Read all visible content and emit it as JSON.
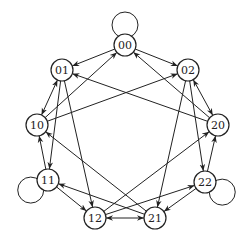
{
  "diagram": {
    "type": "directed-graph",
    "nodes": [
      {
        "id": "00",
        "label": "00",
        "x": 125,
        "y": 45
      },
      {
        "id": "01",
        "label": "01",
        "x": 62,
        "y": 70
      },
      {
        "id": "02",
        "label": "02",
        "x": 188,
        "y": 70
      },
      {
        "id": "10",
        "label": "10",
        "x": 37,
        "y": 125
      },
      {
        "id": "20",
        "label": "20",
        "x": 218,
        "y": 125
      },
      {
        "id": "11",
        "label": "11",
        "x": 48,
        "y": 180
      },
      {
        "id": "22",
        "label": "22",
        "x": 205,
        "y": 182
      },
      {
        "id": "12",
        "label": "12",
        "x": 95,
        "y": 218
      },
      {
        "id": "21",
        "label": "21",
        "x": 155,
        "y": 218
      }
    ],
    "edges": [
      {
        "from": "00",
        "to": "00"
      },
      {
        "from": "00",
        "to": "01"
      },
      {
        "from": "00",
        "to": "02"
      },
      {
        "from": "01",
        "to": "10"
      },
      {
        "from": "01",
        "to": "11"
      },
      {
        "from": "01",
        "to": "12"
      },
      {
        "from": "02",
        "to": "20"
      },
      {
        "from": "02",
        "to": "21"
      },
      {
        "from": "02",
        "to": "22"
      },
      {
        "from": "10",
        "to": "00"
      },
      {
        "from": "10",
        "to": "01"
      },
      {
        "from": "10",
        "to": "02"
      },
      {
        "from": "11",
        "to": "10"
      },
      {
        "from": "11",
        "to": "11"
      },
      {
        "from": "11",
        "to": "12"
      },
      {
        "from": "12",
        "to": "20"
      },
      {
        "from": "12",
        "to": "21"
      },
      {
        "from": "12",
        "to": "22"
      },
      {
        "from": "20",
        "to": "00"
      },
      {
        "from": "20",
        "to": "01"
      },
      {
        "from": "20",
        "to": "02"
      },
      {
        "from": "21",
        "to": "10"
      },
      {
        "from": "21",
        "to": "11"
      },
      {
        "from": "21",
        "to": "12"
      },
      {
        "from": "22",
        "to": "20"
      },
      {
        "from": "22",
        "to": "21"
      },
      {
        "from": "22",
        "to": "22"
      }
    ],
    "colors": {
      "stroke": "#222222",
      "background": "#ffffff"
    }
  }
}
